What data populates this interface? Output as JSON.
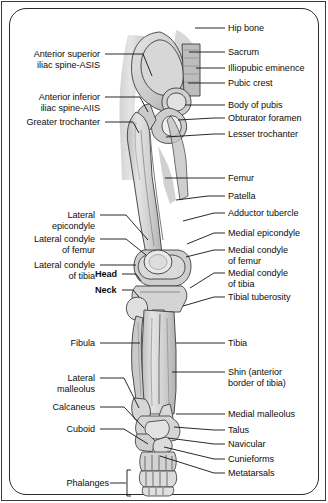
{
  "figure": {
    "frame_color": "#2b2b2b",
    "bone_fill": "#d8d8d8",
    "bone_outline": "#3c3c3c",
    "soft_tissue": "#c9c9c9",
    "leader_color": "#111111",
    "text_color": "#0d0d0d"
  },
  "labels_right": [
    {
      "id": "hip-bone",
      "text": "Hip bone",
      "lines": [
        "Hip bone"
      ]
    },
    {
      "id": "sacrum",
      "text": "Sacrum",
      "lines": [
        "Sacrum"
      ]
    },
    {
      "id": "illiopubic-eminence",
      "text": "Illiopubic eminence",
      "lines": [
        "Illiopubic eminence"
      ]
    },
    {
      "id": "pubic-crest",
      "text": "Pubic crest",
      "lines": [
        "Pubic crest"
      ]
    },
    {
      "id": "body-of-pubis",
      "text": "Body of pubis",
      "lines": [
        "Body of pubis"
      ]
    },
    {
      "id": "obturator-foramen",
      "text": "Obturator foramen",
      "lines": [
        "Obturator foramen"
      ]
    },
    {
      "id": "lesser-trochanter",
      "text": "Lesser trochanter",
      "lines": [
        "Lesser trochanter"
      ]
    },
    {
      "id": "femur",
      "text": "Femur",
      "lines": [
        "Femur"
      ]
    },
    {
      "id": "patella",
      "text": "Patella",
      "lines": [
        "Patella"
      ]
    },
    {
      "id": "adductor-tubercle",
      "text": "Adductor tubercle",
      "lines": [
        "Adductor tubercle"
      ]
    },
    {
      "id": "medial-epicondyle",
      "text": "Medial epicondyle",
      "lines": [
        "Medial epicondyle"
      ]
    },
    {
      "id": "medial-condyle-of-femur",
      "text": "Medial condyle of femur",
      "lines": [
        "Medial condyle",
        "of femur"
      ]
    },
    {
      "id": "medial-condyle-of-tibia",
      "text": "Medial condyle of tibia",
      "lines": [
        "Medial condyle",
        "of tibia"
      ]
    },
    {
      "id": "tibial-tuberosity",
      "text": "Tibial tuberosity",
      "lines": [
        "Tibial tuberosity"
      ]
    },
    {
      "id": "tibia",
      "text": "Tibia",
      "lines": [
        "Tibia"
      ]
    },
    {
      "id": "shin",
      "text": "Shin (anterior border of tibia)",
      "lines": [
        "Shin (anterior",
        "border of tibia)"
      ]
    },
    {
      "id": "medial-malleolus",
      "text": "Medial malleolus",
      "lines": [
        "Medial malleolus"
      ]
    },
    {
      "id": "talus",
      "text": "Talus",
      "lines": [
        "Talus"
      ]
    },
    {
      "id": "navicular",
      "text": "Navicular",
      "lines": [
        "Navicular"
      ]
    },
    {
      "id": "cunieforms",
      "text": "Cunieforms",
      "lines": [
        "Cunieforms"
      ]
    },
    {
      "id": "metatarsals",
      "text": "Metatarsals",
      "lines": [
        "Metatarsals"
      ]
    }
  ],
  "labels_left": [
    {
      "id": "anterior-superior-iliac-spine",
      "text": "Anterior superior iliac spine-ASIS",
      "lines": [
        "Anterior superior",
        "iliac spine-ASIS"
      ]
    },
    {
      "id": "anterior-inferior-iliac-spine",
      "text": "Anterior inferior iliac spine-AIIS",
      "lines": [
        "Anterior inferior",
        "iliac spine-AIIS"
      ]
    },
    {
      "id": "greater-trochanter",
      "text": "Greater trochanter",
      "lines": [
        "Greater trochanter"
      ]
    },
    {
      "id": "lateral-epicondyle",
      "text": "Lateral epicondyle",
      "lines": [
        "Lateral",
        "epicondyle"
      ]
    },
    {
      "id": "lateral-condyle-of-femur",
      "text": "Lateral condyle of femur",
      "lines": [
        "Lateral condyle",
        "of femur"
      ]
    },
    {
      "id": "lateral-condyle-of-tibia",
      "text": "Lateral condyle of tibia",
      "lines": [
        "Lateral condyle",
        "of tibia"
      ]
    },
    {
      "id": "fibula",
      "text": "Fibula",
      "lines": [
        "Fibula"
      ]
    },
    {
      "id": "lateral-malleolus",
      "text": "Lateral malleolus",
      "lines": [
        "Lateral",
        "malleolus"
      ]
    },
    {
      "id": "calcaneus",
      "text": "Calcaneus",
      "lines": [
        "Calcaneus"
      ]
    },
    {
      "id": "cuboid",
      "text": "Cuboid",
      "lines": [
        "Cuboid"
      ]
    },
    {
      "id": "phalanges",
      "text": "Phalanges",
      "lines": [
        "Phalanges"
      ]
    }
  ],
  "labels_inline": [
    {
      "id": "head",
      "text": "Head",
      "bold": true
    },
    {
      "id": "neck",
      "text": "Neck",
      "bold": true
    }
  ]
}
